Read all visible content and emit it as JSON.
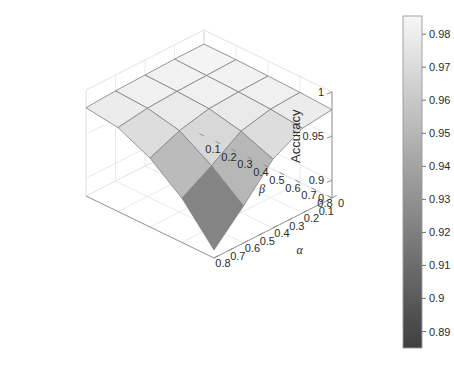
{
  "figure": {
    "background": "#ffffff",
    "type": "surface-3d"
  },
  "axes": {
    "z": {
      "label": "Accuracy",
      "ticks": [
        "1",
        "0.95",
        "0.9"
      ],
      "tick_values": [
        1,
        0.95,
        0.9
      ],
      "range": [
        0.88,
        1.0
      ]
    },
    "beta": {
      "label": "β",
      "ticks": [
        "0",
        "0.1",
        "0.2",
        "0.3",
        "0.4",
        "0.5",
        "0.6",
        "0.7",
        "0.8"
      ],
      "tick_values": [
        0,
        0.1,
        0.2,
        0.3,
        0.4,
        0.5,
        0.6,
        0.7,
        0.8
      ],
      "range": [
        0,
        0.8
      ]
    },
    "alpha": {
      "label": "α",
      "ticks": [
        "0",
        "0.1",
        "0.2",
        "0.3",
        "0.4",
        "0.5",
        "0.6",
        "0.7",
        "0.8"
      ],
      "tick_values": [
        0,
        0.1,
        0.2,
        0.3,
        0.4,
        0.5,
        0.6,
        0.7,
        0.8
      ],
      "range": [
        0,
        0.8
      ]
    }
  },
  "colorbar": {
    "ticks": [
      "0.98",
      "0.97",
      "0.96",
      "0.95",
      "0.94",
      "0.93",
      "0.92",
      "0.91",
      "0.9",
      "0.89"
    ],
    "tick_values": [
      0.98,
      0.97,
      0.96,
      0.95,
      0.94,
      0.93,
      0.92,
      0.91,
      0.9,
      0.89
    ],
    "min": 0.885,
    "max": 0.9855,
    "low_color": "#3f3f3f",
    "high_color": "#f7f7f7",
    "orientation": "vertical",
    "position": "right"
  },
  "chart_data": {
    "type": "surface",
    "title": "",
    "xlabel": "α",
    "ylabel": "β",
    "zlabel": "Accuracy",
    "x": [
      0,
      0.2,
      0.4,
      0.6,
      0.8
    ],
    "y": [
      0,
      0.2,
      0.4,
      0.6,
      0.8
    ],
    "zlim": [
      0.88,
      1.0
    ],
    "clim": [
      0.885,
      0.9855
    ],
    "colormap": "gray",
    "grid": true,
    "legend": "none",
    "note": "z[i][j]: i indexes beta (y) 0..0.8, j indexes alpha (x) 0..0.8",
    "z": [
      [
        0.984,
        0.984,
        0.983,
        0.982,
        0.98
      ],
      [
        0.984,
        0.983,
        0.982,
        0.98,
        0.975
      ],
      [
        0.983,
        0.982,
        0.98,
        0.972,
        0.958
      ],
      [
        0.982,
        0.98,
        0.972,
        0.95,
        0.93
      ],
      [
        0.98,
        0.976,
        0.958,
        0.922,
        0.889
      ]
    ]
  }
}
